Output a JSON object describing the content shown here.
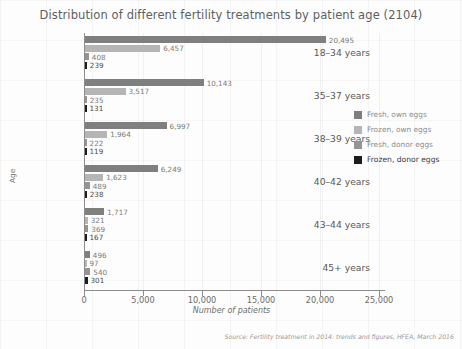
{
  "chart_data": {
    "type": "bar",
    "orientation": "horizontal",
    "title": "Distribution of different fertility treatments by patient age (2104)",
    "xlabel": "Number of patients",
    "ylabel": "Age",
    "categories": [
      "18–34 years",
      "35–37 years",
      "38–39 years",
      "40–42 years",
      "43–44 years",
      "45+ years"
    ],
    "series": [
      {
        "name": "Fresh, own eggs",
        "color": "#7f7f7f",
        "values": [
          20495,
          10143,
          6997,
          6249,
          1717,
          496
        ],
        "labels": [
          "20,495",
          "10,143",
          "6,997",
          "6,249",
          "1,717",
          "496"
        ]
      },
      {
        "name": "Frozen, own eggs",
        "color": "#b5b5b5",
        "values": [
          6457,
          3517,
          1964,
          1623,
          321,
          97
        ],
        "labels": [
          "6,457",
          "3,517",
          "1,964",
          "1,623",
          "321",
          "97"
        ]
      },
      {
        "name": "Fresh, donor eggs",
        "color": "#949494",
        "values": [
          408,
          235,
          222,
          489,
          369,
          540
        ],
        "labels": [
          "408",
          "235",
          "222",
          "489",
          "369",
          "540"
        ]
      },
      {
        "name": "Frozen, donor eggs",
        "color": "#1c1c1c",
        "values": [
          239,
          131,
          119,
          238,
          167,
          301
        ],
        "labels": [
          "239",
          "131",
          "119",
          "238",
          "167",
          "301"
        ]
      }
    ],
    "xlim": [
      0,
      25000
    ],
    "xticks": [
      0,
      5000,
      10000,
      15000,
      20000,
      25000
    ],
    "xticklabels": [
      "0",
      "5,000",
      "10,000",
      "15,000",
      "20,000",
      "25,000"
    ],
    "grid": true,
    "legend_position": "right",
    "source": "Source: Fertility treatment in 2014: trends and figures, HFEA, March 2016"
  }
}
